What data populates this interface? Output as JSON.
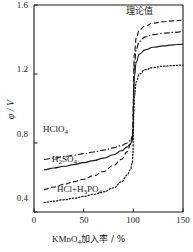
{
  "chart_data": {
    "type": "line",
    "title": "",
    "xlabel_parts": {
      "head": "KMnO",
      "sub": "4",
      "tail": "加入率 / %"
    },
    "ylabel": "φ / V",
    "xlim": [
      0,
      150
    ],
    "ylim": [
      0.4,
      1.6
    ],
    "xticks": [
      0,
      50,
      100,
      150
    ],
    "xticklabels": [
      "0",
      "50",
      "100",
      "150"
    ],
    "yticks": [
      0.4,
      0.8,
      1.2,
      1.6
    ],
    "yticklabels": [
      "0.4",
      "0.8",
      "1.2",
      "1.6"
    ],
    "grid": false,
    "legend": "inline-annotations",
    "series": [
      {
        "name": "理论值",
        "label": "理论值",
        "style": "dashed",
        "color": "#1a1a1a",
        "x": [
          10,
          20,
          30,
          40,
          50,
          60,
          70,
          80,
          88,
          94,
          97,
          99,
          99.6,
          100,
          100.4,
          101,
          103,
          106,
          112,
          120,
          130,
          140,
          150
        ],
        "y": [
          0.53,
          0.545,
          0.56,
          0.575,
          0.59,
          0.61,
          0.635,
          0.67,
          0.705,
          0.75,
          0.79,
          0.85,
          0.92,
          1.04,
          1.2,
          1.32,
          1.41,
          1.455,
          1.48,
          1.495,
          1.503,
          1.508,
          1.512
        ]
      },
      {
        "name": "HClO4",
        "label_parts": {
          "head": "HClO",
          "sub": "4"
        },
        "style": "dashdot",
        "color": "#1a1a1a",
        "x": [
          10,
          20,
          30,
          40,
          50,
          60,
          70,
          80,
          88,
          94,
          97,
          99,
          99.6,
          100,
          100.4,
          101,
          103,
          106,
          112,
          120,
          130,
          140,
          150
        ],
        "y": [
          0.705,
          0.713,
          0.721,
          0.729,
          0.738,
          0.748,
          0.759,
          0.772,
          0.786,
          0.8,
          0.815,
          0.835,
          0.875,
          0.99,
          1.14,
          1.255,
          1.345,
          1.39,
          1.415,
          1.428,
          1.436,
          1.441,
          1.445
        ]
      },
      {
        "name": "H2SO4",
        "label_parts": {
          "head": "H",
          "sub": "2",
          "mid": "SO",
          "sub2": "4"
        },
        "style": "solid",
        "color": "#1a1a1a",
        "x": [
          10,
          20,
          30,
          40,
          50,
          60,
          70,
          80,
          88,
          94,
          97,
          99,
          99.6,
          100,
          100.4,
          101,
          103,
          106,
          112,
          120,
          130,
          140,
          150
        ],
        "y": [
          0.645,
          0.655,
          0.665,
          0.675,
          0.686,
          0.698,
          0.712,
          0.732,
          0.755,
          0.778,
          0.795,
          0.815,
          0.85,
          0.95,
          1.08,
          1.185,
          1.27,
          1.315,
          1.34,
          1.355,
          1.363,
          1.369,
          1.373
        ]
      },
      {
        "name": "HCl+H3PO4",
        "label_parts": {
          "head": "HCl+H",
          "sub": "3",
          "mid": "PO",
          "sub2": "4"
        },
        "style": "dotted",
        "color": "#1a1a1a",
        "x": [
          10,
          20,
          30,
          40,
          50,
          60,
          70,
          80,
          88,
          94,
          97,
          99,
          99.6,
          100,
          100.4,
          101,
          103,
          106,
          112,
          120,
          130,
          140,
          150
        ],
        "y": [
          0.455,
          0.463,
          0.471,
          0.48,
          0.49,
          0.502,
          0.517,
          0.54,
          0.575,
          0.615,
          0.645,
          0.685,
          0.735,
          0.84,
          0.97,
          1.07,
          1.155,
          1.2,
          1.225,
          1.238,
          1.245,
          1.249,
          1.252
        ]
      }
    ],
    "annotations": [
      {
        "name": "theoretical-curve-label",
        "text": "理论值",
        "x_px": 126,
        "y_px": 6
      },
      {
        "name": "hclo4-curve-label",
        "x_px": 43,
        "y_px": 125
      },
      {
        "name": "h2so4-curve-label",
        "x_px": 52,
        "y_px": 155
      },
      {
        "name": "hcl-h3po4-curve-label",
        "x_px": 57,
        "y_px": 185
      }
    ]
  },
  "axes": {
    "y_title": "φ / V",
    "x_title_head": "KMnO",
    "x_title_sub": "4",
    "x_title_tail": "加入率 / %"
  }
}
